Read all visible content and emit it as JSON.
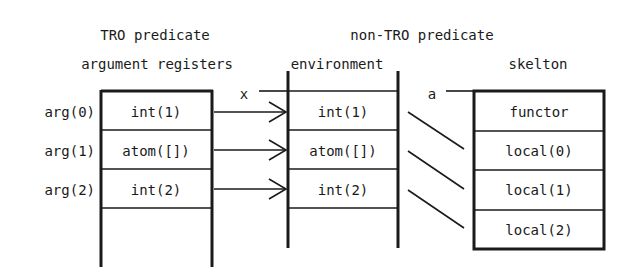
{
  "titles": {
    "tro_line1": "TRO predicate",
    "tro_line2": "argument registers",
    "nontro_line1": "non-TRO predicate",
    "environment": "environment",
    "skelton": "skelton"
  },
  "pointer_labels": {
    "x": "x",
    "a": "a"
  },
  "registers": {
    "row_labels": [
      "arg(0)",
      "arg(1)",
      "arg(2)"
    ],
    "cells": [
      "int(1)",
      "atom([])",
      "int(2)"
    ]
  },
  "environment": {
    "cells": [
      "int(1)",
      "atom([])",
      "int(2)"
    ]
  },
  "skelton": {
    "cells": [
      "functor",
      "local(0)",
      "local(1)",
      "local(2)"
    ]
  },
  "colors": {
    "ink": "#1a1a1a",
    "background": "#ffffff"
  }
}
